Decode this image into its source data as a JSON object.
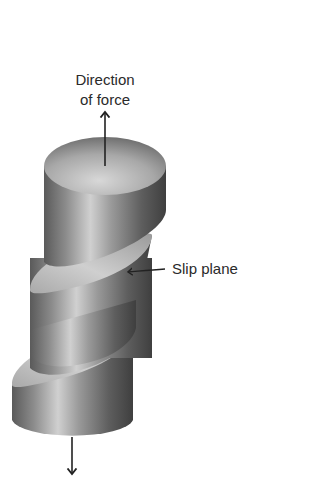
{
  "figure": {
    "type": "diagram",
    "labels": {
      "direction_line1": "Direction",
      "direction_line2": "of force",
      "slip_plane": "Slip plane"
    },
    "segments": 3,
    "colors": {
      "background": "#ffffff",
      "text": "#2a2a2a",
      "arrow": "#222222",
      "cylinder_dark": "#4a4a4a",
      "cylinder_mid": "#8a8a8a",
      "cylinder_light": "#d6d6d6",
      "plane_light": "#cfcfcf",
      "plane_dark": "#8f8f8f"
    }
  }
}
